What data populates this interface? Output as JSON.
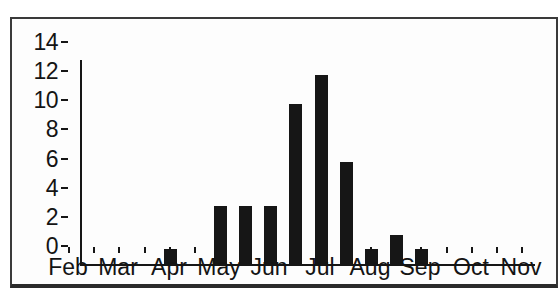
{
  "chart_data": {
    "type": "bar",
    "title": "",
    "xlabel": "",
    "ylabel": "",
    "legend": false,
    "grid": false,
    "month_labels": [
      "Feb",
      "Mar",
      "Apr",
      "May",
      "Jun",
      "Jul",
      "Aug",
      "Sep",
      "Oct",
      "Nov"
    ],
    "bin_unit": "half-month",
    "bin_labels": [
      "Feb 1st half",
      "Feb 2nd half",
      "Mar 1st half",
      "Mar 2nd half",
      "Apr 1st half",
      "Apr 2nd half",
      "May 1st half",
      "May 2nd half",
      "Jun 1st half",
      "Jun 2nd half",
      "Jul 1st half",
      "Jul 2nd half",
      "Aug 1st half",
      "Aug 2nd half",
      "Sep 1st half",
      "Sep 2nd half",
      "Oct 1st half",
      "Oct 2nd half"
    ],
    "values": [
      0,
      0,
      0,
      1,
      0,
      4,
      4,
      4,
      11,
      13,
      7,
      1,
      2,
      1,
      0,
      0,
      0,
      0
    ],
    "y_ticks": [
      0,
      2,
      4,
      6,
      8,
      10,
      12,
      14
    ],
    "ylim": [
      0,
      14
    ]
  },
  "colors": {
    "bar": "#161616",
    "axis": "#161616",
    "text": "#141414",
    "frame_border": "#3a3a3a",
    "background": "#ffffff"
  }
}
